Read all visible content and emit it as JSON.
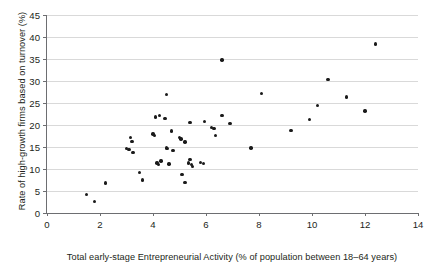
{
  "chart_data": {
    "type": "scatter",
    "title": "",
    "xlabel": "Total early-stage Entrepreneurial Activity (% of population between 18–64 years)",
    "ylabel": "Rate of high-growth firms based on turnover (%)",
    "xlim": [
      0,
      14
    ],
    "ylim": [
      0,
      45
    ],
    "xticks": [
      0,
      2,
      4,
      6,
      8,
      10,
      12,
      14
    ],
    "yticks": [
      0,
      5,
      10,
      15,
      20,
      25,
      30,
      35,
      40,
      45
    ],
    "xtick_labels": [
      "0",
      "2",
      "4",
      "6",
      "8",
      "10",
      "12",
      "14"
    ],
    "ytick_labels": [
      "0",
      "5",
      "10",
      "15",
      "20",
      "25",
      "30",
      "35",
      "40",
      "45"
    ],
    "grid": "horizontal",
    "legend": "none",
    "marker": "filled-circle",
    "marker_color": "#1a1a1a",
    "points": [
      [
        1.5,
        4.2
      ],
      [
        1.8,
        2.6
      ],
      [
        2.2,
        6.8
      ],
      [
        3.0,
        14.6
      ],
      [
        3.1,
        14.4
      ],
      [
        3.15,
        17.1
      ],
      [
        3.2,
        16.3
      ],
      [
        3.25,
        13.8
      ],
      [
        3.5,
        9.2
      ],
      [
        3.6,
        7.5
      ],
      [
        4.0,
        18.0
      ],
      [
        4.05,
        17.6
      ],
      [
        4.1,
        21.8
      ],
      [
        4.15,
        11.4
      ],
      [
        4.2,
        11.0
      ],
      [
        4.25,
        22.2
      ],
      [
        4.3,
        11.8
      ],
      [
        4.45,
        21.5
      ],
      [
        4.5,
        27.0
      ],
      [
        4.5,
        14.8
      ],
      [
        4.55,
        14.6
      ],
      [
        4.6,
        11.1
      ],
      [
        4.7,
        18.6
      ],
      [
        4.75,
        14.2
      ],
      [
        5.0,
        17.1
      ],
      [
        5.05,
        16.8
      ],
      [
        5.1,
        8.8
      ],
      [
        5.2,
        16.1
      ],
      [
        5.2,
        6.9
      ],
      [
        5.35,
        11.4
      ],
      [
        5.4,
        12.2
      ],
      [
        5.4,
        20.6
      ],
      [
        5.45,
        11.0
      ],
      [
        5.5,
        10.6
      ],
      [
        5.8,
        11.5
      ],
      [
        5.9,
        11.2
      ],
      [
        5.95,
        20.8
      ],
      [
        6.2,
        19.4
      ],
      [
        6.3,
        19.2
      ],
      [
        6.35,
        17.6
      ],
      [
        6.6,
        34.8
      ],
      [
        6.6,
        22.2
      ],
      [
        6.9,
        20.3
      ],
      [
        7.7,
        14.8
      ],
      [
        8.1,
        27.1
      ],
      [
        9.2,
        18.7
      ],
      [
        9.9,
        21.2
      ],
      [
        10.2,
        24.4
      ],
      [
        10.6,
        30.3
      ],
      [
        11.3,
        26.4
      ],
      [
        12.0,
        23.2
      ],
      [
        12.4,
        38.4
      ]
    ]
  }
}
